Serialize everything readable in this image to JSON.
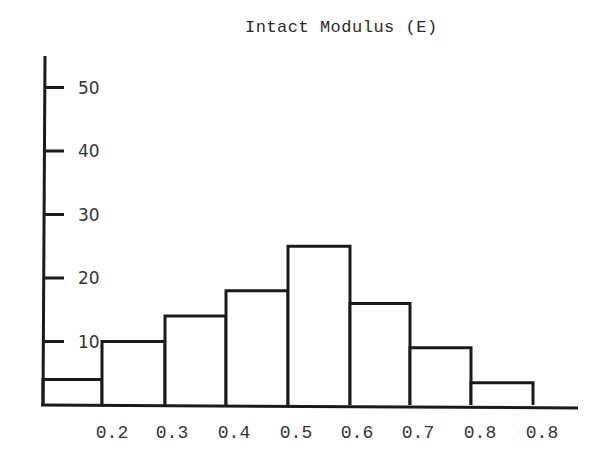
{
  "chart_data": {
    "type": "bar",
    "title": "Intact Modulus (E)",
    "xlabel": "",
    "ylabel": "",
    "histogram": true,
    "x_tick_labels": [
      "0.2",
      "0.3",
      "0.4",
      "0.5",
      "0.6",
      "0.7",
      "0.8",
      "0.8"
    ],
    "y_ticks": [
      10,
      20,
      30,
      40,
      50
    ],
    "ylim": [
      0,
      55
    ],
    "grid": false,
    "legend": null,
    "bins": [
      {
        "from": "0.1",
        "to": "0.2"
      },
      {
        "from": "0.2",
        "to": "0.3"
      },
      {
        "from": "0.3",
        "to": "0.4"
      },
      {
        "from": "0.4",
        "to": "0.5"
      },
      {
        "from": "0.5",
        "to": "0.6"
      },
      {
        "from": "0.6",
        "to": "0.7"
      },
      {
        "from": "0.7",
        "to": "0.8"
      },
      {
        "from": "0.8",
        "to": "0.9"
      }
    ],
    "values": [
      4,
      10,
      14,
      18,
      25,
      16,
      9,
      3.5
    ]
  },
  "colors": {
    "line": "#1a1a1a",
    "text": "#333333",
    "background": "#ffffff"
  }
}
